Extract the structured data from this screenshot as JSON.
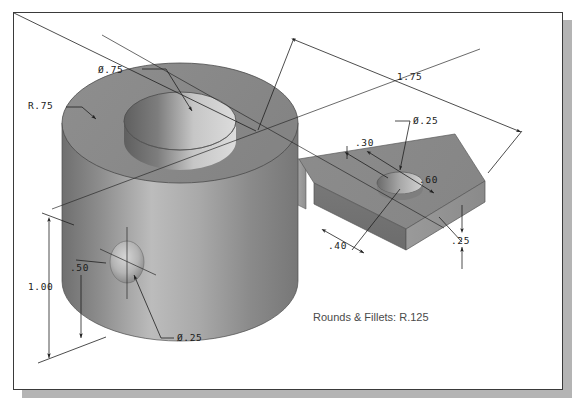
{
  "sheet": {
    "background_color": "#ffffff",
    "border_color": "#3a3a3a",
    "shadow_color": "#b4b4b4"
  },
  "part": {
    "description": "Isometric shaded 3D solid model of a machined bracket: large cylindrical boss with through hole joined by a thin web to a rectangular arm with a small through hole",
    "face_colors": {
      "top_face": "#8b8b8b",
      "front_light": "#b6b6b6",
      "front_dark": "#7b7b7b",
      "side_shadow": "#6e6e6e",
      "bore_dark": "#6a6a6a",
      "bore_light": "#cfcfcf",
      "edge": "#4a4a4a"
    }
  },
  "dimensions": [
    {
      "id": "dia-75",
      "label": "Ø.75",
      "kind": "diameter",
      "feature": "cylinder-through-hole"
    },
    {
      "id": "rad-75",
      "label": "R.75",
      "kind": "radius",
      "feature": "cylinder-outer-radius"
    },
    {
      "id": "len-175",
      "label": "1.75",
      "kind": "linear",
      "feature": "overall-length"
    },
    {
      "id": "dia-25-arm",
      "label": "Ø.25",
      "kind": "diameter",
      "feature": "arm-through-hole"
    },
    {
      "id": "d-30",
      "label": ".30",
      "kind": "linear",
      "feature": "hole-offset-from-arm-edge"
    },
    {
      "id": "d-60",
      "label": ".60",
      "kind": "linear",
      "feature": "arm-width"
    },
    {
      "id": "d-40",
      "label": ".40",
      "kind": "linear",
      "feature": "hole-offset-along-arm"
    },
    {
      "id": "d-25",
      "label": ".25",
      "kind": "linear",
      "feature": "arm-thickness"
    },
    {
      "id": "h-100",
      "label": "1.00",
      "kind": "linear",
      "feature": "cylinder-height"
    },
    {
      "id": "h-50",
      "label": ".50",
      "kind": "linear",
      "feature": "side-hole-height"
    },
    {
      "id": "dia-25-side",
      "label": "Ø.25",
      "kind": "diameter",
      "feature": "cylinder-side-hole"
    }
  ],
  "notes": {
    "rounds_and_fillets": "Rounds & Fillets: R.125"
  }
}
